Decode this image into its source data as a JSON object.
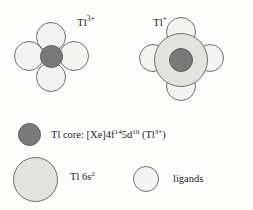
{
  "figure": {
    "background_color": "#fdfdfc",
    "colors": {
      "core": "#797979",
      "shell_6s2": "#e2e2de",
      "ligand": "#f3f3f1",
      "outline": "#6f6f6f",
      "text": "#1d1d1d"
    }
  },
  "diagrams": [
    {
      "id": "tl3plus",
      "label_text": "Tl",
      "label_charge": "3+",
      "label_full": "Tl3+",
      "has_6s2_shell": false,
      "core_label": "Tl core",
      "ligand_count": 4,
      "ligand_positions": [
        "top",
        "left",
        "right",
        "bottom"
      ]
    },
    {
      "id": "tl1plus",
      "label_text": "Tl",
      "label_charge": "+",
      "label_full": "Tl+",
      "has_6s2_shell": true,
      "core_label": "Tl core",
      "ligand_count": 4,
      "ligand_positions": [
        "top",
        "left",
        "right",
        "bottom"
      ]
    }
  ],
  "legend": {
    "items": [
      {
        "id": "tl-core",
        "swatch": "core",
        "prefix": "Tl core: [Xe]4f",
        "sup1": "14",
        "mid": "5d",
        "sup2": "10",
        "suffix_open": " (Tl",
        "sup3": "3+",
        "suffix_close": ")",
        "full_text": "Tl core: [Xe]4f14 5d10 (Tl3+)"
      },
      {
        "id": "tl-6s2",
        "swatch": "shell_6s2",
        "prefix": "Tl 6s",
        "sup1": "2",
        "full_text": "Tl 6s2"
      },
      {
        "id": "ligands",
        "swatch": "ligand",
        "prefix": "ligands",
        "full_text": "ligands"
      }
    ]
  }
}
